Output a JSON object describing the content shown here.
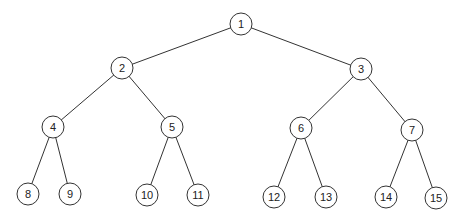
{
  "diagram": {
    "type": "binary-tree",
    "node_radius": 11,
    "colors": {
      "stroke": "#333333",
      "fill": "#ffffff",
      "text": "#222222"
    },
    "nodes": [
      {
        "id": "1",
        "label": "1",
        "x": 241,
        "y": 24
      },
      {
        "id": "2",
        "label": "2",
        "x": 122,
        "y": 68
      },
      {
        "id": "3",
        "label": "3",
        "x": 361,
        "y": 69
      },
      {
        "id": "4",
        "label": "4",
        "x": 53,
        "y": 127
      },
      {
        "id": "5",
        "label": "5",
        "x": 172,
        "y": 127
      },
      {
        "id": "6",
        "label": "6",
        "x": 301,
        "y": 128
      },
      {
        "id": "7",
        "label": "7",
        "x": 412,
        "y": 130
      },
      {
        "id": "8",
        "label": "8",
        "x": 28,
        "y": 194
      },
      {
        "id": "9",
        "label": "9",
        "x": 70,
        "y": 194
      },
      {
        "id": "10",
        "label": "10",
        "x": 147,
        "y": 195
      },
      {
        "id": "11",
        "label": "11",
        "x": 198,
        "y": 195
      },
      {
        "id": "12",
        "label": "12",
        "x": 274,
        "y": 197
      },
      {
        "id": "13",
        "label": "13",
        "x": 326,
        "y": 197
      },
      {
        "id": "14",
        "label": "14",
        "x": 386,
        "y": 197
      },
      {
        "id": "15",
        "label": "15",
        "x": 436,
        "y": 198
      }
    ],
    "edges": [
      [
        "1",
        "2"
      ],
      [
        "1",
        "3"
      ],
      [
        "2",
        "4"
      ],
      [
        "2",
        "5"
      ],
      [
        "3",
        "6"
      ],
      [
        "3",
        "7"
      ],
      [
        "4",
        "8"
      ],
      [
        "4",
        "9"
      ],
      [
        "5",
        "10"
      ],
      [
        "5",
        "11"
      ],
      [
        "6",
        "12"
      ],
      [
        "6",
        "13"
      ],
      [
        "7",
        "14"
      ],
      [
        "7",
        "15"
      ]
    ]
  }
}
